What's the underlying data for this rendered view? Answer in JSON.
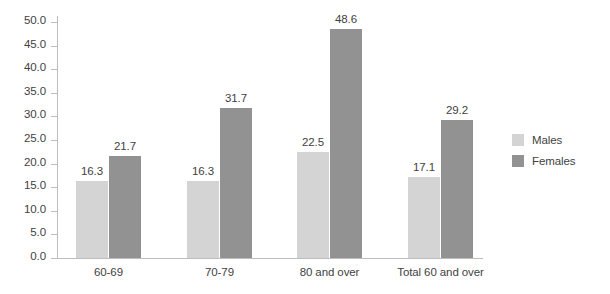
{
  "chart_data": {
    "type": "bar",
    "title": "",
    "subtitle": "",
    "xlabel": "",
    "ylabel": "",
    "categories": [
      "60-69",
      "70-79",
      "80 and over",
      "Total 60 and over"
    ],
    "series": [
      {
        "name": "Males",
        "color": "#d4d4d4",
        "values": [
          16.3,
          16.3,
          22.5,
          17.1
        ]
      },
      {
        "name": "Females",
        "color": "#929292",
        "values": [
          21.7,
          31.7,
          48.6,
          29.2
        ]
      }
    ],
    "value_labels": {
      "males": [
        "16.3",
        "16.3",
        "22.5",
        "17.1"
      ],
      "females": [
        "21.7",
        "31.7",
        "48.6",
        "29.2"
      ]
    },
    "ylim": [
      0.0,
      50.0
    ],
    "ytick_step": 5.0,
    "ytick_labels": [
      "50.0",
      "45.0",
      "40.0",
      "35.0",
      "30.0",
      "25.0",
      "20.0",
      "15.0",
      "10.0",
      "5.0",
      "0.0"
    ],
    "ytick_values": [
      50.0,
      45.0,
      40.0,
      35.0,
      30.0,
      25.0,
      20.0,
      15.0,
      10.0,
      5.0,
      0.0
    ],
    "grid": false,
    "legend_position": "right",
    "legend": [
      "Males",
      "Females"
    ],
    "data_labels_shown": true
  },
  "axis": {
    "tick_color": "#bdbdbd",
    "label_color": "#3f3f3f"
  },
  "legend": {
    "items": [
      {
        "label": "Males",
        "color": "#d4d4d4"
      },
      {
        "label": "Females",
        "color": "#929292"
      }
    ]
  },
  "background": "#ffffff"
}
